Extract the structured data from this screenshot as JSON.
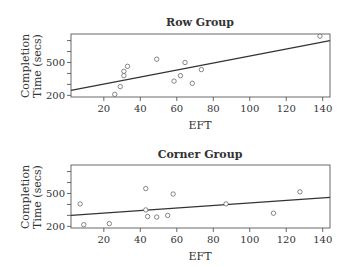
{
  "chart_data": [
    {
      "type": "scatter",
      "title": "Row Group",
      "xlabel": "EFT",
      "ylabel": "Completion Time (secs)",
      "ylabel_lines": [
        "Completion",
        "Time (secs)"
      ],
      "xticks": [
        20,
        40,
        60,
        80,
        100,
        120,
        140
      ],
      "yticks_labeled": [
        200,
        500
      ],
      "yticks_minor": [
        300,
        400,
        600,
        700
      ],
      "xlim": [
        2,
        144
      ],
      "ylim": [
        185,
        760
      ],
      "grid": false,
      "points": [
        {
          "x": 26,
          "y": 209
        },
        {
          "x": 29,
          "y": 280
        },
        {
          "x": 31,
          "y": 380
        },
        {
          "x": 31,
          "y": 420
        },
        {
          "x": 33,
          "y": 465
        },
        {
          "x": 49,
          "y": 530
        },
        {
          "x": 58.5,
          "y": 330
        },
        {
          "x": 62,
          "y": 380
        },
        {
          "x": 64.5,
          "y": 500
        },
        {
          "x": 68.5,
          "y": 310
        },
        {
          "x": 73.5,
          "y": 435
        },
        {
          "x": 138.5,
          "y": 740
        }
      ],
      "fit_line": {
        "x": [
          2,
          144
        ],
        "y": [
          245,
          700
        ]
      }
    },
    {
      "type": "scatter",
      "title": "Corner Group",
      "xlabel": "EFT",
      "ylabel": "Completion Time (secs)",
      "ylabel_lines": [
        "Completion",
        "Time (secs)"
      ],
      "xticks": [
        20,
        40,
        60,
        80,
        100,
        120,
        140
      ],
      "yticks_labeled": [
        200,
        500
      ],
      "yticks_minor": [
        300,
        400,
        600,
        700
      ],
      "xlim": [
        2,
        144
      ],
      "ylim": [
        185,
        760
      ],
      "grid": false,
      "points": [
        {
          "x": 7,
          "y": 405
        },
        {
          "x": 9,
          "y": 215
        },
        {
          "x": 23,
          "y": 225
        },
        {
          "x": 43,
          "y": 545
        },
        {
          "x": 43,
          "y": 350
        },
        {
          "x": 44,
          "y": 290
        },
        {
          "x": 49,
          "y": 285
        },
        {
          "x": 55,
          "y": 300
        },
        {
          "x": 58,
          "y": 495
        },
        {
          "x": 87,
          "y": 405
        },
        {
          "x": 113,
          "y": 320
        },
        {
          "x": 127.5,
          "y": 515
        }
      ],
      "fit_line": {
        "x": [
          2,
          144
        ],
        "y": [
          300,
          465
        ]
      }
    }
  ],
  "panels": [
    {
      "title": "Row Group",
      "xlabel": "EFT",
      "ylabel_line1": "Completion",
      "ylabel_line2": "Time (secs)"
    },
    {
      "title": "Corner Group",
      "xlabel": "EFT",
      "ylabel_line1": "Completion",
      "ylabel_line2": "Time (secs)"
    }
  ],
  "colors": {
    "axis": "#444444",
    "line": "#333333",
    "point": "#555555",
    "text": "#333333"
  }
}
